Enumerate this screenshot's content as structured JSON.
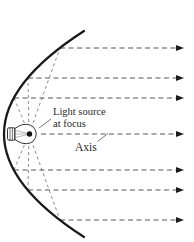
{
  "diagram": {
    "labels": {
      "light_source_line1": "Light source",
      "light_source_line2": "at focus",
      "axis": "Axis"
    },
    "colors": {
      "background": "#ffffff",
      "curve": "#1a1a1a",
      "reflected_ray": "#565656",
      "focal_ray": "#6e6e6e",
      "arrowhead": "#1c1c1c",
      "bulb_outline": "#333333",
      "filament_dot": "#111111",
      "leader_line": "#555555",
      "text": "#2a2a2a"
    },
    "parabola": {
      "start": [
        84,
        31
      ],
      "control": [
        -76,
        134
      ],
      "end": [
        84,
        237
      ]
    },
    "focus": {
      "x": 29,
      "y": 134
    },
    "reflected_rays": [
      {
        "y": 48,
        "x_start": 60,
        "x_end": 176,
        "is_axis": false
      },
      {
        "y": 78,
        "x_start": 28,
        "x_end": 176,
        "is_axis": false
      },
      {
        "y": 98,
        "x_start": 14,
        "x_end": 176,
        "is_axis": false
      },
      {
        "y": 134,
        "x_start": 41,
        "x_end": 176,
        "is_axis": true
      },
      {
        "y": 170,
        "x_start": 14,
        "x_end": 176,
        "is_axis": false
      },
      {
        "y": 190,
        "x_start": 28,
        "x_end": 176,
        "is_axis": false
      },
      {
        "y": 220,
        "x_start": 60,
        "x_end": 176,
        "is_axis": false
      }
    ],
    "arrow_tip_x": 184,
    "focal_ray_targets": [
      [
        60,
        48
      ],
      [
        28,
        78
      ],
      [
        14,
        98
      ],
      [
        14,
        170
      ],
      [
        28,
        190
      ],
      [
        60,
        220
      ]
    ]
  }
}
